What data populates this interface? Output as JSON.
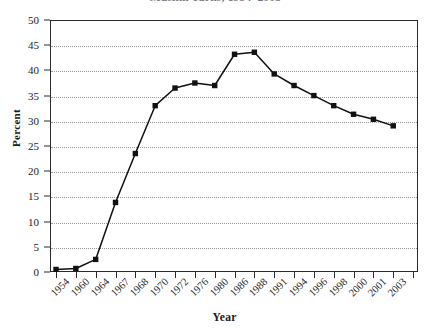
{
  "chart_data": {
    "type": "line",
    "title": "Muslim Turks, 1954–2003",
    "subtitle": "",
    "xlabel": "Year",
    "ylabel": "Percent",
    "categories": [
      "1954",
      "1960",
      "1964",
      "1967",
      "1968",
      "1970",
      "1972",
      "1976",
      "1980",
      "1986",
      "1988",
      "1991",
      "1994",
      "1996",
      "1998",
      "2000",
      "2001",
      "2003"
    ],
    "x": [
      "1954",
      "1960",
      "1964",
      "1967",
      "1968",
      "1970",
      "1972",
      "1976",
      "1980",
      "1986",
      "1988",
      "1991",
      "1994",
      "1996",
      "1998",
      "2000",
      "2001",
      "2003"
    ],
    "values": [
      0.5,
      0.7,
      2.5,
      13.8,
      23.5,
      33.0,
      36.5,
      37.5,
      37.0,
      43.2,
      43.6,
      39.3,
      37.0,
      35.0,
      33.0,
      31.3,
      30.3,
      29.0
    ],
    "series": [
      {
        "name": "Percent",
        "values": [
          0.5,
          0.7,
          2.5,
          13.8,
          23.5,
          33.0,
          36.5,
          37.5,
          37.0,
          43.2,
          43.6,
          39.3,
          37.0,
          35.0,
          33.0,
          31.3,
          30.3,
          29.0
        ],
        "marker": "square",
        "color": "#111111"
      }
    ],
    "y_ticks": [
      0,
      5,
      10,
      15,
      20,
      25,
      30,
      35,
      40,
      45,
      50
    ],
    "y_tick_labels": [
      "0",
      "5",
      "10",
      "15",
      "20",
      "25",
      "30",
      "35",
      "40",
      "45",
      "50"
    ],
    "ylim": [
      0,
      50
    ],
    "grid": "horizontal-dotted",
    "legend": "none",
    "legend_position": "none",
    "line_color": "#111111",
    "grid_color": "#9a9a9a",
    "frame_color": "#2b2b2b",
    "x_tick_positions": 19,
    "annotations": []
  }
}
